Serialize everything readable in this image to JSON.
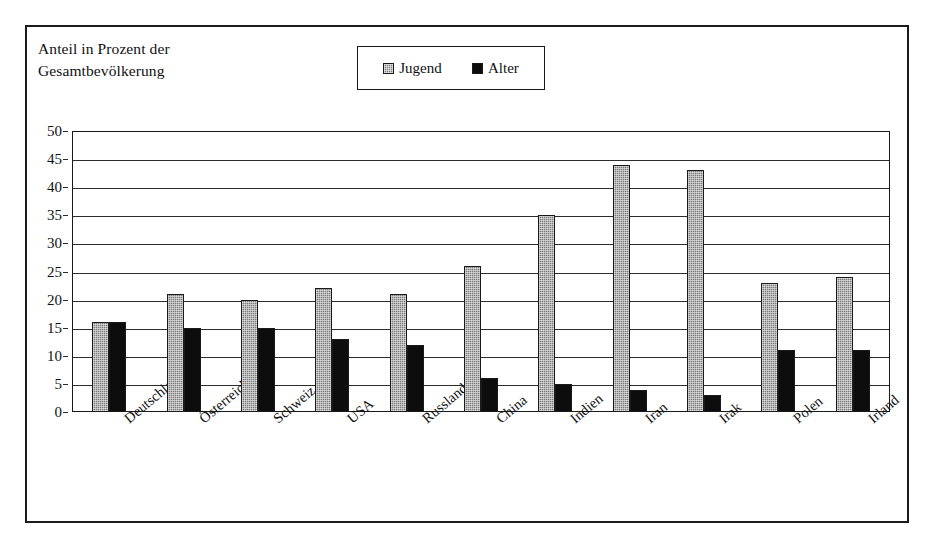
{
  "chart_data": {
    "type": "bar",
    "title": "Anteil in Prozent der Gesamtbevölkerung",
    "title_lines": [
      "Anteil in Prozent der",
      "Gesamtbevölkerung"
    ],
    "xlabel": "",
    "ylabel": "",
    "ylim": [
      0,
      50
    ],
    "ytick_step": 5,
    "yticks": [
      50,
      45,
      40,
      35,
      30,
      25,
      20,
      15,
      10,
      5,
      0
    ],
    "grid": "horizontal",
    "legend_position": "top-center",
    "categories": [
      "Deutschland",
      "Österreich",
      "Schweiz",
      "USA",
      "Russland",
      "China",
      "Indien",
      "Iran",
      "Irak",
      "Polen",
      "Irland"
    ],
    "series": [
      {
        "name": "Jugend",
        "color": "#797979",
        "values": [
          16,
          21,
          20,
          22,
          21,
          26,
          35,
          44,
          43,
          23,
          24
        ]
      },
      {
        "name": "Alter",
        "color": "#0d0d0d",
        "values": [
          16,
          15,
          15,
          13,
          12,
          6,
          5,
          4,
          3,
          11,
          11
        ]
      }
    ]
  },
  "legend": {
    "items": [
      {
        "label": "Jugend",
        "swatch": "jugend"
      },
      {
        "label": "Alter",
        "swatch": "alter"
      }
    ]
  },
  "colors": {
    "frame": "#1a1a1a",
    "grid": "#2b2b2b",
    "text": "#111111",
    "background": "#ffffff",
    "series_jugend": "#797979",
    "series_alter": "#0d0d0d"
  }
}
